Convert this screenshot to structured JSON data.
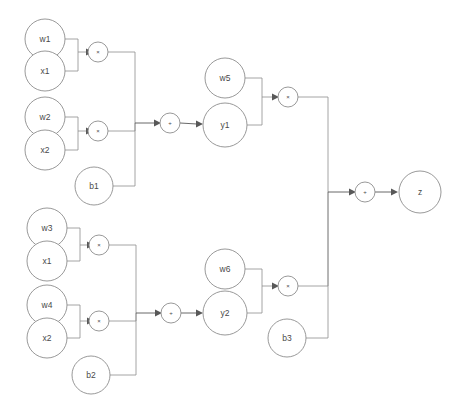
{
  "diagram": {
    "type": "computational-graph",
    "background_color": "#ffffff",
    "node_stroke_color": "#8d8d8d",
    "node_fill_color": "#ffffff",
    "label_color": "#4a4a4a",
    "edge_color": "#8d8d8d",
    "arrow_color": "#585858",
    "nodes": [
      {
        "id": "w1",
        "label": "w1",
        "kind": "variable",
        "cx": 45,
        "cy": 39,
        "r": 20
      },
      {
        "id": "x1a",
        "label": "x1",
        "kind": "variable",
        "cx": 45,
        "cy": 71,
        "r": 20
      },
      {
        "id": "mul1",
        "label": "×",
        "kind": "operator",
        "cx": 98,
        "cy": 52,
        "r": 10
      },
      {
        "id": "w2",
        "label": "w2",
        "kind": "variable",
        "cx": 45,
        "cy": 117,
        "r": 20
      },
      {
        "id": "x2a",
        "label": "x2",
        "kind": "variable",
        "cx": 45,
        "cy": 150,
        "r": 20
      },
      {
        "id": "mul2",
        "label": "×",
        "kind": "operator",
        "cx": 98,
        "cy": 131,
        "r": 10
      },
      {
        "id": "b1",
        "label": "b1",
        "kind": "variable",
        "cx": 94,
        "cy": 186,
        "r": 19
      },
      {
        "id": "sum1",
        "label": "+",
        "kind": "operator",
        "cx": 170,
        "cy": 123,
        "r": 10
      },
      {
        "id": "w5",
        "label": "w5",
        "kind": "variable",
        "cx": 225,
        "cy": 78,
        "r": 20
      },
      {
        "id": "y1",
        "label": "y1",
        "kind": "variable",
        "cx": 225,
        "cy": 125,
        "r": 22
      },
      {
        "id": "mul5",
        "label": "×",
        "kind": "operator",
        "cx": 288,
        "cy": 97,
        "r": 10
      },
      {
        "id": "w3",
        "label": "w3",
        "kind": "variable",
        "cx": 47,
        "cy": 228,
        "r": 20
      },
      {
        "id": "x1b",
        "label": "x1",
        "kind": "variable",
        "cx": 47,
        "cy": 261,
        "r": 20
      },
      {
        "id": "mul3",
        "label": "×",
        "kind": "operator",
        "cx": 99,
        "cy": 245,
        "r": 10
      },
      {
        "id": "w4",
        "label": "w4",
        "kind": "variable",
        "cx": 47,
        "cy": 305,
        "r": 20
      },
      {
        "id": "x2b",
        "label": "x2",
        "kind": "variable",
        "cx": 47,
        "cy": 338,
        "r": 20
      },
      {
        "id": "mul4",
        "label": "×",
        "kind": "operator",
        "cx": 99,
        "cy": 321,
        "r": 10
      },
      {
        "id": "b2",
        "label": "b2",
        "kind": "variable",
        "cx": 91,
        "cy": 375,
        "r": 19
      },
      {
        "id": "sum2",
        "label": "+",
        "kind": "operator",
        "cx": 171,
        "cy": 313,
        "r": 10
      },
      {
        "id": "w6",
        "label": "w6",
        "kind": "variable",
        "cx": 225,
        "cy": 269,
        "r": 20
      },
      {
        "id": "y2",
        "label": "y2",
        "kind": "variable",
        "cx": 225,
        "cy": 313,
        "r": 22
      },
      {
        "id": "mul6",
        "label": "×",
        "kind": "operator",
        "cx": 288,
        "cy": 286,
        "r": 10
      },
      {
        "id": "b3",
        "label": "b3",
        "kind": "variable",
        "cx": 287,
        "cy": 338,
        "r": 19
      },
      {
        "id": "sum3",
        "label": "+",
        "kind": "operator",
        "cx": 365,
        "cy": 192,
        "r": 10
      },
      {
        "id": "z",
        "label": "z",
        "kind": "output",
        "cx": 420,
        "cy": 192,
        "r": 21
      }
    ],
    "edges": [
      {
        "from": "w1",
        "to": "mul1"
      },
      {
        "from": "x1a",
        "to": "mul1"
      },
      {
        "from": "w2",
        "to": "mul2"
      },
      {
        "from": "x2a",
        "to": "mul2"
      },
      {
        "from": "mul1",
        "to": "sum1"
      },
      {
        "from": "mul2",
        "to": "sum1"
      },
      {
        "from": "b1",
        "to": "sum1"
      },
      {
        "from": "sum1",
        "to": "y1"
      },
      {
        "from": "w5",
        "to": "mul5"
      },
      {
        "from": "y1",
        "to": "mul5"
      },
      {
        "from": "w3",
        "to": "mul3"
      },
      {
        "from": "x1b",
        "to": "mul3"
      },
      {
        "from": "w4",
        "to": "mul4"
      },
      {
        "from": "x2b",
        "to": "mul4"
      },
      {
        "from": "mul3",
        "to": "sum2"
      },
      {
        "from": "mul4",
        "to": "sum2"
      },
      {
        "from": "b2",
        "to": "sum2"
      },
      {
        "from": "sum2",
        "to": "y2"
      },
      {
        "from": "w6",
        "to": "mul6"
      },
      {
        "from": "y2",
        "to": "mul6"
      },
      {
        "from": "mul5",
        "to": "sum3"
      },
      {
        "from": "mul6",
        "to": "sum3"
      },
      {
        "from": "b3",
        "to": "sum3"
      },
      {
        "from": "sum3",
        "to": "z"
      }
    ],
    "operator_symbols": {
      "multiply": "×",
      "add": "+"
    }
  }
}
